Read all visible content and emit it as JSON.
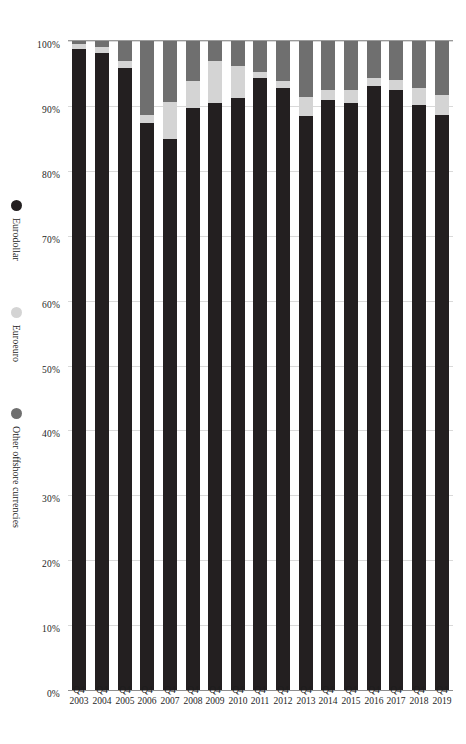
{
  "chart_data": {
    "type": "bar",
    "orientation": "horizontal-stacked-100",
    "title": "",
    "subtitle": "",
    "xlabel": "",
    "ylabel": "",
    "xlim": [
      0,
      100
    ],
    "x_tick_labels": [
      "100%",
      "90%",
      "80%",
      "70%",
      "60%",
      "50%",
      "40%",
      "30%",
      "20%",
      "10%",
      "0%"
    ],
    "x_tick_values": [
      100,
      90,
      80,
      70,
      60,
      50,
      40,
      30,
      20,
      10,
      0
    ],
    "x_axis_reversed": true,
    "grid": true,
    "legend_position": "right",
    "categories": [
      "Q4 2003",
      "Q4 2004",
      "Q4 2005",
      "Q4 2006",
      "Q4 2007",
      "Q4 2008",
      "Q4 2009",
      "Q4 2010",
      "Q4 2011",
      "Q4 2012",
      "Q4 2013",
      "Q4 2014",
      "Q4 2015",
      "Q4 2016",
      "Q4 2017",
      "Q4 2018",
      "Q4 2019"
    ],
    "category_lines": [
      [
        "Q4",
        "2003"
      ],
      [
        "Q4",
        "2004"
      ],
      [
        "Q4",
        "2005"
      ],
      [
        "Q4",
        "2006"
      ],
      [
        "Q4",
        "2007"
      ],
      [
        "Q4",
        "2008"
      ],
      [
        "Q4",
        "2009"
      ],
      [
        "Q4",
        "2010"
      ],
      [
        "Q4",
        "2011"
      ],
      [
        "Q4",
        "2012"
      ],
      [
        "Q4",
        "2013"
      ],
      [
        "Q4",
        "2014"
      ],
      [
        "Q4",
        "2015"
      ],
      [
        "Q4",
        "2016"
      ],
      [
        "Q4",
        "2017"
      ],
      [
        "Q4",
        "2018"
      ],
      [
        "Q4",
        "2019"
      ]
    ],
    "series": [
      {
        "name": "Eurodollar",
        "key": "eurodollar",
        "color": "#231f20",
        "values": [
          98.7,
          98.2,
          95.9,
          87.3,
          84.9,
          89.6,
          90.4,
          91.2,
          94.3,
          92.8,
          88.5,
          90.9,
          90.4,
          93.0,
          92.4,
          90.1,
          88.6
        ]
      },
      {
        "name": "Euroeuro",
        "key": "euroeuro",
        "color": "#d4d4d4",
        "values": [
          0.8,
          0.8,
          1.0,
          1.3,
          5.7,
          4.2,
          6.5,
          4.9,
          1.0,
          1.0,
          2.9,
          1.6,
          2.1,
          1.3,
          1.6,
          2.6,
          3.1
        ]
      },
      {
        "name": "Other offshore currencies",
        "key": "offshore",
        "color": "#6f6f6f",
        "values": [
          0.5,
          1.0,
          3.1,
          11.4,
          9.4,
          6.2,
          3.1,
          3.9,
          4.7,
          6.2,
          8.6,
          7.5,
          7.5,
          5.7,
          6.0,
          7.3,
          8.3
        ]
      }
    ]
  },
  "legend": {
    "items": [
      {
        "label": "Eurodollar",
        "color": "#231f20"
      },
      {
        "label": "Euroeuro",
        "color": "#d4d4d4"
      },
      {
        "label": "Other offshore currencies",
        "color": "#6f6f6f"
      }
    ]
  }
}
